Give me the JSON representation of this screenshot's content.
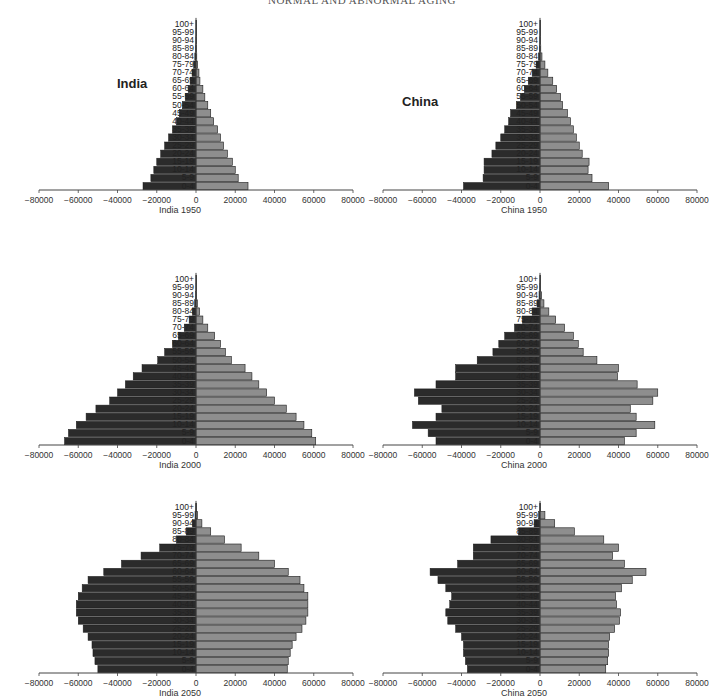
{
  "header": {
    "running_title": "NORMAL AND ABNORMAL AGING"
  },
  "legend_note": "Left (dark) bars = male population, right (grey) bars = female population; values in thousands",
  "colors": {
    "male_bar": "#2b2b2b",
    "female_bar": "#8e8e8e",
    "bar_stroke": "#1a1a1a",
    "axis": "#444444"
  },
  "age_groups": [
    "0-4",
    "5-9",
    "10-14",
    "15-19",
    "20-24",
    "25-29",
    "30-34",
    "35-39",
    "40-44",
    "45-49",
    "50-54",
    "55-59",
    "60-64",
    "65-69",
    "70-74",
    "75-79",
    "80-84",
    "85-89",
    "90-94",
    "95-99",
    "100+"
  ],
  "x_ticks": [
    "-80000",
    "-60000",
    "-40000",
    "-20000",
    "0",
    "20000",
    "40000",
    "60000",
    "80000"
  ],
  "panels": [
    {
      "id": "india-1950",
      "country_label": "India",
      "caption": "India 1950"
    },
    {
      "id": "china-1950",
      "country_label": "China",
      "caption": "China 1950"
    },
    {
      "id": "india-2000",
      "country_label": "",
      "caption": "India 2000"
    },
    {
      "id": "china-2000",
      "country_label": "",
      "caption": "China 2000"
    },
    {
      "id": "india-2050",
      "country_label": "",
      "caption": "India 2050"
    },
    {
      "id": "china-2050",
      "country_label": "",
      "caption": "China 2050"
    }
  ],
  "chart_data": [
    {
      "type": "bar",
      "title": "India 1950",
      "orientation": "horizontal population pyramid",
      "categories": [
        "0-4",
        "5-9",
        "10-14",
        "15-19",
        "20-24",
        "25-29",
        "30-34",
        "35-39",
        "40-44",
        "45-49",
        "50-54",
        "55-59",
        "60-64",
        "65-69",
        "70-74",
        "75-79",
        "80-84",
        "85-89",
        "90-94",
        "95-99",
        "100+"
      ],
      "series": [
        {
          "name": "Male",
          "values": [
            -27000,
            -23000,
            -21500,
            -20000,
            -18000,
            -16000,
            -14000,
            -12000,
            -10000,
            -8500,
            -7000,
            -5500,
            -4000,
            -3000,
            -2000,
            -1200,
            -600,
            -250,
            -80,
            -20,
            -5
          ]
        },
        {
          "name": "Female",
          "values": [
            26500,
            21500,
            20000,
            18500,
            16000,
            14000,
            12500,
            11000,
            9000,
            7500,
            6000,
            4500,
            3500,
            2000,
            1500,
            800,
            400,
            150,
            50,
            10,
            5
          ]
        }
      ],
      "annotation": "India",
      "xlabel": "India 1950",
      "ylabel": "",
      "xlim": [
        -80000,
        80000
      ],
      "xticks": [
        -80000,
        -60000,
        -40000,
        -20000,
        0,
        20000,
        40000,
        60000,
        80000
      ],
      "grid": false,
      "legend": "none"
    },
    {
      "type": "bar",
      "title": "China 1950",
      "orientation": "horizontal population pyramid",
      "categories": [
        "0-4",
        "5-9",
        "10-14",
        "15-19",
        "20-24",
        "25-29",
        "30-34",
        "35-39",
        "40-44",
        "45-49",
        "50-54",
        "55-59",
        "60-64",
        "65-69",
        "70-74",
        "75-79",
        "80-84",
        "85-89",
        "90-94",
        "95-99",
        "100+"
      ],
      "series": [
        {
          "name": "Male",
          "values": [
            -39000,
            -29000,
            -28500,
            -28500,
            -24500,
            -22500,
            -20000,
            -18000,
            -16000,
            -15000,
            -12000,
            -10000,
            -8000,
            -6000,
            -4000,
            -2000,
            -800,
            -300,
            -100,
            -20,
            -5
          ]
        },
        {
          "name": "Female",
          "values": [
            35000,
            26500,
            24500,
            25000,
            21500,
            20000,
            18500,
            17000,
            15500,
            14000,
            11500,
            10500,
            8500,
            6500,
            4000,
            2500,
            1000,
            400,
            150,
            40,
            5
          ]
        }
      ],
      "annotation": "China",
      "xlabel": "China 1950",
      "ylabel": "",
      "xlim": [
        -80000,
        80000
      ],
      "xticks": [
        -80000,
        -60000,
        -40000,
        -20000,
        0,
        20000,
        40000,
        60000,
        80000
      ],
      "grid": false,
      "legend": "none"
    },
    {
      "type": "bar",
      "title": "India 2000",
      "orientation": "horizontal population pyramid",
      "categories": [
        "0-4",
        "5-9",
        "10-14",
        "15-19",
        "20-24",
        "25-29",
        "30-34",
        "35-39",
        "40-44",
        "45-49",
        "50-54",
        "55-59",
        "60-64",
        "65-69",
        "70-74",
        "75-79",
        "80-84",
        "85-89",
        "90-94",
        "95-99",
        "100+"
      ],
      "series": [
        {
          "name": "Male",
          "values": [
            -67000,
            -65000,
            -61000,
            -56000,
            -51000,
            -44000,
            -40000,
            -36000,
            -32000,
            -27500,
            -19500,
            -16000,
            -12000,
            -9000,
            -6000,
            -3500,
            -1800,
            -700,
            -150,
            -30,
            -5
          ]
        },
        {
          "name": "Female",
          "values": [
            61000,
            59000,
            55000,
            51000,
            46000,
            40000,
            36000,
            32000,
            28500,
            25000,
            18000,
            15000,
            12500,
            9500,
            6000,
            3500,
            1800,
            700,
            200,
            40,
            5
          ]
        }
      ],
      "xlabel": "India 2000",
      "ylabel": "",
      "xlim": [
        -80000,
        80000
      ],
      "xticks": [
        -80000,
        -60000,
        -40000,
        -20000,
        0,
        20000,
        40000,
        60000,
        80000
      ],
      "grid": false,
      "legend": "none"
    },
    {
      "type": "bar",
      "title": "China 2000",
      "orientation": "horizontal population pyramid",
      "categories": [
        "0-4",
        "5-9",
        "10-14",
        "15-19",
        "20-24",
        "25-29",
        "30-34",
        "35-39",
        "40-44",
        "45-49",
        "50-54",
        "55-59",
        "60-64",
        "65-69",
        "70-74",
        "75-79",
        "80-84",
        "85-89",
        "90-94",
        "95-99",
        "100+"
      ],
      "series": [
        {
          "name": "Male",
          "values": [
            -53000,
            -57000,
            -65000,
            -53000,
            -50000,
            -62000,
            -64000,
            -53000,
            -43000,
            -43000,
            -32000,
            -24000,
            -21000,
            -18000,
            -13000,
            -9000,
            -4000,
            -1500,
            -500,
            -100,
            -10
          ]
        },
        {
          "name": "Female",
          "values": [
            43000,
            49000,
            58500,
            49000,
            46000,
            57500,
            60000,
            49500,
            39500,
            40000,
            29000,
            22000,
            19500,
            17000,
            12500,
            8000,
            4500,
            2000,
            800,
            200,
            20
          ]
        }
      ],
      "xlabel": "China 2000",
      "ylabel": "",
      "xlim": [
        -80000,
        80000
      ],
      "xticks": [
        -80000,
        -60000,
        -40000,
        -20000,
        0,
        20000,
        40000,
        60000,
        80000
      ],
      "grid": false,
      "legend": "none"
    },
    {
      "type": "bar",
      "title": "India 2050",
      "orientation": "horizontal population pyramid",
      "categories": [
        "0-4",
        "5-9",
        "10-14",
        "15-19",
        "20-24",
        "25-29",
        "30-34",
        "35-39",
        "40-44",
        "45-49",
        "50-54",
        "55-59",
        "60-64",
        "65-69",
        "70-74",
        "75-79",
        "80-84",
        "85-89",
        "90-94",
        "95-99",
        "100+"
      ],
      "series": [
        {
          "name": "Male",
          "values": [
            -50000,
            -51500,
            -52500,
            -53000,
            -55000,
            -57500,
            -60000,
            -61000,
            -61000,
            -60000,
            -58000,
            -55000,
            -47000,
            -38000,
            -28000,
            -18500,
            -10000,
            -5000,
            -1800,
            -500,
            -100
          ]
        },
        {
          "name": "Female",
          "values": [
            46500,
            47000,
            48000,
            49000,
            51000,
            54000,
            56000,
            57000,
            57000,
            57000,
            55000,
            53000,
            47000,
            40000,
            32000,
            23000,
            14500,
            7500,
            3000,
            800,
            200
          ]
        }
      ],
      "xlabel": "India 2050",
      "ylabel": "",
      "xlim": [
        -80000,
        80000
      ],
      "xticks": [
        -80000,
        -60000,
        -40000,
        -20000,
        0,
        20000,
        40000,
        60000,
        80000
      ],
      "grid": false,
      "legend": "none"
    },
    {
      "type": "bar",
      "title": "China 2050",
      "orientation": "horizontal population pyramid",
      "categories": [
        "0-4",
        "5-9",
        "10-14",
        "15-19",
        "20-24",
        "25-29",
        "30-34",
        "35-39",
        "40-44",
        "45-49",
        "50-54",
        "55-59",
        "60-64",
        "65-69",
        "70-74",
        "75-79",
        "80-84",
        "85-89",
        "90-94",
        "95-99",
        "100+"
      ],
      "series": [
        {
          "name": "Male",
          "values": [
            -37000,
            -38000,
            -39000,
            -39000,
            -40000,
            -43000,
            -47000,
            -48000,
            -46000,
            -45000,
            -48000,
            -52000,
            -56000,
            -42000,
            -34000,
            -34000,
            -25000,
            -11000,
            -3000,
            -700,
            -100
          ]
        },
        {
          "name": "Female",
          "values": [
            33500,
            34500,
            35000,
            35000,
            35500,
            38000,
            40500,
            41000,
            39000,
            38500,
            41500,
            47000,
            54000,
            43000,
            37000,
            40000,
            32500,
            17500,
            7500,
            2500,
            300
          ]
        }
      ],
      "xlabel": "China 2050",
      "ylabel": "",
      "xlim": [
        -80000,
        80000
      ],
      "xticks": [
        -80000,
        -60000,
        -40000,
        -20000,
        0,
        20000,
        40000,
        60000,
        80000
      ],
      "grid": false,
      "legend": "none"
    }
  ]
}
